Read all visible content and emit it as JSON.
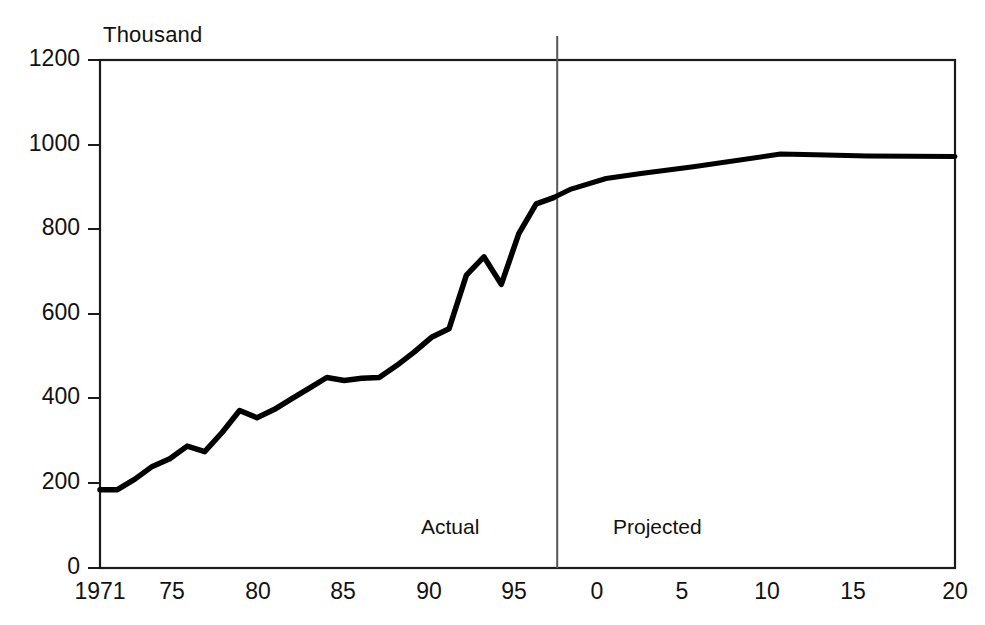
{
  "chart_data": {
    "type": "line",
    "title": "",
    "subtitle": "",
    "xlabel": "",
    "ylabel": "Thousand",
    "y_unit_label": "Thousand",
    "xlim": [
      1971,
      2020
    ],
    "ylim": [
      0,
      1200
    ],
    "grid": false,
    "legend": null,
    "x_tick_labels": [
      "1971",
      "75",
      "80",
      "85",
      "90",
      "95",
      "0",
      "5",
      "10",
      "15",
      "20"
    ],
    "x_tick_values": [
      1971,
      1975,
      1980,
      1985,
      1990,
      1995,
      2000,
      2005,
      2010,
      2015,
      2020
    ],
    "y_tick_labels": [
      "0",
      "200",
      "400",
      "600",
      "800",
      "1000",
      "1200"
    ],
    "y_tick_values": [
      0,
      200,
      400,
      600,
      800,
      1000,
      1200
    ],
    "annotations": [
      {
        "text": "Actual",
        "x": 1992.0,
        "region": "left-of-divider"
      },
      {
        "text": "Projected",
        "x": 2003.0,
        "region": "right-of-divider"
      }
    ],
    "divider": {
      "x": 1997.2,
      "style": "vertical-line",
      "color": "#555555"
    },
    "line_color": "#000000",
    "line_width": 5,
    "series": [
      {
        "name": "Actual",
        "segment": "actual",
        "x": [
          1971,
          1972,
          1973,
          1974,
          1975,
          1976,
          1977,
          1978,
          1979,
          1980,
          1981,
          1982,
          1983,
          1984,
          1985,
          1986,
          1987,
          1988,
          1989,
          1990,
          1991,
          1992,
          1993,
          1994,
          1995,
          1996,
          1997
        ],
        "values": [
          185,
          185,
          210,
          240,
          258,
          288,
          275,
          320,
          372,
          355,
          375,
          400,
          425,
          450,
          443,
          448,
          450,
          478,
          510,
          545,
          565,
          692,
          735,
          670,
          790,
          860,
          875
        ]
      },
      {
        "name": "Projected",
        "segment": "projected",
        "x": [
          1997,
          1998,
          2000,
          2002,
          2005,
          2010,
          2012,
          2015,
          2020
        ],
        "values": [
          875,
          895,
          920,
          932,
          948,
          978,
          976,
          973,
          972
        ]
      }
    ]
  },
  "axis": {
    "unit_label": "Thousand"
  }
}
